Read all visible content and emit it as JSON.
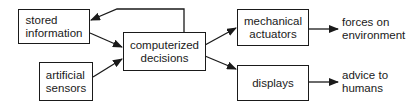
{
  "diagram": {
    "nodes": {
      "stored_information": {
        "line1": "stored",
        "line2": "information"
      },
      "artificial_sensors": {
        "line1": "artificial",
        "line2": "sensors"
      },
      "computerized_decisions": {
        "line1": "computerized",
        "line2": "decisions"
      },
      "mechanical_actuators": {
        "line1": "mechanical",
        "line2": "actuators"
      },
      "displays": {
        "line1": "displays"
      }
    },
    "outputs": {
      "forces": {
        "line1": "forces on",
        "line2": "environment"
      },
      "advice": {
        "line1": "advice to",
        "line2": "humans"
      }
    },
    "edges": [
      {
        "from": "stored information",
        "to": "computerized decisions"
      },
      {
        "from": "artificial sensors",
        "to": "computerized decisions"
      },
      {
        "from": "computerized decisions",
        "to": "stored information"
      },
      {
        "from": "computerized decisions",
        "to": "mechanical actuators"
      },
      {
        "from": "computerized decisions",
        "to": "displays"
      },
      {
        "from": "mechanical actuators",
        "to": "forces on environment"
      },
      {
        "from": "displays",
        "to": "advice to humans"
      }
    ]
  }
}
